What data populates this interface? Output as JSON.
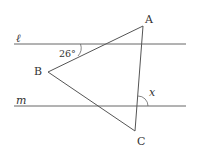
{
  "diagram": {
    "type": "geometry",
    "lines": [
      {
        "name": "line-l",
        "label": "ℓ",
        "y": 44
      },
      {
        "name": "line-m",
        "label": "m",
        "y": 106
      }
    ],
    "vertices": [
      {
        "name": "A",
        "label": "A",
        "x": 143,
        "y": 26
      },
      {
        "name": "B",
        "label": "B",
        "x": 48,
        "y": 72
      },
      {
        "name": "C",
        "label": "C",
        "x": 135,
        "y": 131
      }
    ],
    "angles": [
      {
        "name": "angle-26",
        "label": "26°"
      },
      {
        "name": "angle-x",
        "label": "x"
      }
    ],
    "color": "#555555"
  }
}
